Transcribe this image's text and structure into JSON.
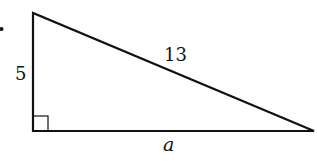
{
  "diagram": {
    "type": "right-triangle",
    "labels": {
      "vertical_leg": "5",
      "hypotenuse": "13",
      "horizontal_leg": "a"
    },
    "vertices": {
      "top": [
        33,
        13
      ],
      "right_angle": [
        33,
        131
      ],
      "right": [
        314,
        131
      ]
    },
    "right_angle_marker": true,
    "colors": {
      "stroke": "#111111",
      "background": "#ffffff"
    }
  }
}
